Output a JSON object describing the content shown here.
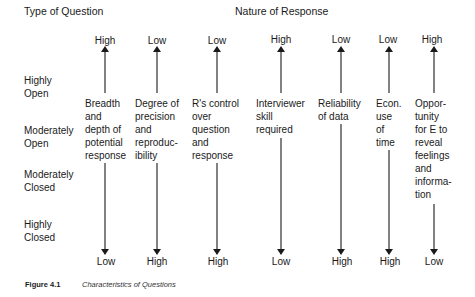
{
  "headers": {
    "type_of_question": "Type of Question",
    "nature_of_response": "Nature of Response"
  },
  "row_labels": [
    {
      "text": "Highly\nOpen"
    },
    {
      "text": "Moderately\nOpen"
    },
    {
      "text": "Moderately\nClosed"
    },
    {
      "text": "Highly\nClosed"
    }
  ],
  "columns": [
    {
      "top": "High",
      "bottom": "Low",
      "description": "Breadth\nand\ndepth of\npotential\nresponse"
    },
    {
      "top": "Low",
      "bottom": "High",
      "description": "Degree of\nprecision\nand\nreproduc-\nibility"
    },
    {
      "top": "Low",
      "bottom": "High",
      "description": "R's control\nover\nquestion\nand\nresponse"
    },
    {
      "top": "High",
      "bottom": "Low",
      "description": "Interviewer\nskill\nrequired"
    },
    {
      "top": "Low",
      "bottom": "High",
      "description": "Reliability\nof data"
    },
    {
      "top": "Low",
      "bottom": "High",
      "description": "Econ.\nuse\nof\ntime"
    },
    {
      "top": "High",
      "bottom": "Low",
      "description": "Oppor-\ntunity\nfor E to\nreveal\nfeelings\nand\ninforma-\ntion"
    }
  ],
  "caption": {
    "figure": "Figure 4.1",
    "title": "Characteristics of Questions"
  }
}
